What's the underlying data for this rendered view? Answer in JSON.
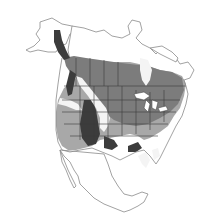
{
  "map": {
    "title": "",
    "region": "North America",
    "style": "grayscale range map",
    "colors": {
      "background": "#ffffff",
      "outline": "#8a8a8a",
      "border": "#3a3a3a",
      "range_light": "#a8a8a8",
      "range_medium": "#7c7c7c",
      "range_dark": "#3c3c3c",
      "white_gap": "#f4f4f4"
    },
    "shading_levels": [
      "light",
      "medium",
      "dark"
    ]
  }
}
